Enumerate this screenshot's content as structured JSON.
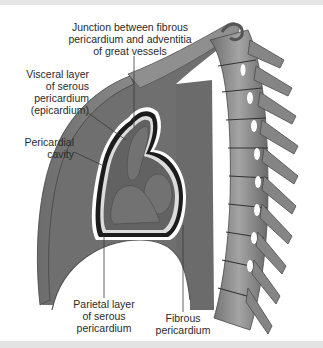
{
  "figure": {
    "colors": {
      "background": "#ffffff",
      "band": "#e5e5e5",
      "mediastinum": "#6f6f6f",
      "chest_wall": "#7d7d7d",
      "heart": "#5e5e5e",
      "pericardial_cavity": "#1a1a1a",
      "bone": "#8a8a8a",
      "label_text": "#2a2a2a",
      "leader_line": "#3a3a3a"
    }
  },
  "labels": {
    "junction": "Junction between fibrous\npericardium and adventitia\nof great vessels",
    "visceral": "Visceral layer\nof serous\npericardium\n(epicardium)",
    "cavity": "Pericardial\ncavity",
    "parietal": "Parietal layer\nof serous\npericardium",
    "fibrous": "Fibrous\npericardium"
  }
}
